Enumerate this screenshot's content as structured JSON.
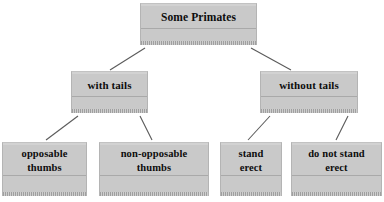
{
  "diagram": {
    "type": "hierarchy-tree",
    "title": "Some Primates",
    "background_color": "#ffffff",
    "node_fill_color": "#c9c9c9",
    "node_border_color": "#b4b4b4",
    "text_color": "#0d0d0d",
    "connector_color": "#5a5a5a",
    "nodes": [
      {
        "id": "root",
        "label": "Some Primates",
        "level": 0
      },
      {
        "id": "with-tails",
        "label": "with tails",
        "level": 1
      },
      {
        "id": "without-tails",
        "label": "without tails",
        "level": 1
      },
      {
        "id": "opposable",
        "label": "opposable\nthumbs",
        "level": 2
      },
      {
        "id": "non-opposable",
        "label": "non-opposable\nthumbs",
        "level": 2
      },
      {
        "id": "stand-erect",
        "label": "stand\nerect",
        "level": 2
      },
      {
        "id": "not-stand-erect",
        "label": "do not stand\nerect",
        "level": 2
      }
    ],
    "edges": [
      {
        "from": "root",
        "to": "with-tails"
      },
      {
        "from": "root",
        "to": "without-tails"
      },
      {
        "from": "with-tails",
        "to": "opposable"
      },
      {
        "from": "with-tails",
        "to": "non-opposable"
      },
      {
        "from": "without-tails",
        "to": "stand-erect"
      },
      {
        "from": "without-tails",
        "to": "not-stand-erect"
      }
    ]
  }
}
